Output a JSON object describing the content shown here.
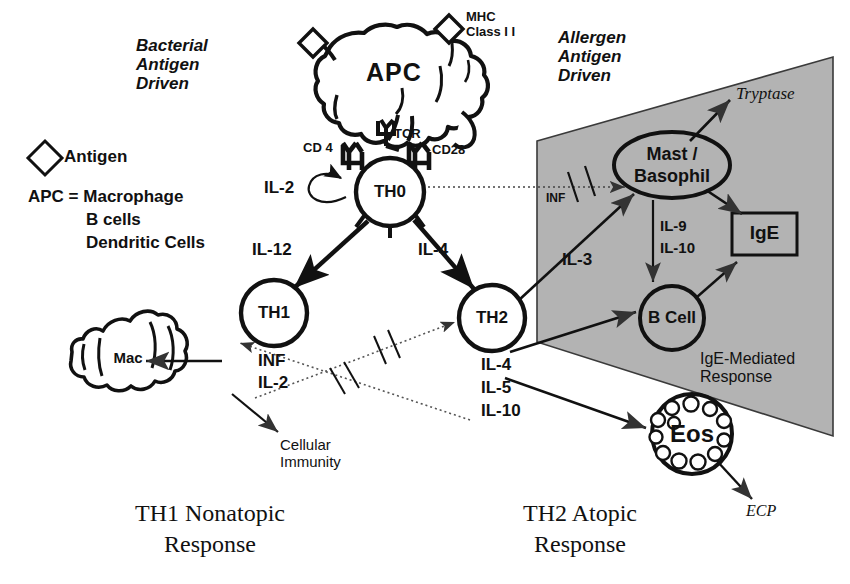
{
  "diagram": {
    "title_left": "TH1 Nonatopic\nResponse",
    "title_right": "TH2 Atopic\nResponse",
    "headers": {
      "left": "Bacterial\nAntigen\nDriven",
      "right": "Allergen\nAntigen\nDriven"
    },
    "legend": {
      "antigen_label": "Antigen",
      "apc_line1": "APC = Macrophage",
      "apc_line2": "B cells",
      "apc_line3": "Dendritic Cells"
    },
    "cells": {
      "apc": "APC",
      "th0": "TH0",
      "th1": "TH1",
      "th2": "TH2",
      "mac": "Mac",
      "mast": "Mast /",
      "basophil": "Basophil",
      "bcell": "B Cell",
      "eos": "Eos",
      "ige": "IgE"
    },
    "receptors": {
      "mhc": "MHC\nClass I I",
      "cd4": "CD 4",
      "tcr": "TCR",
      "cd28": "CD28"
    },
    "cytokines": {
      "il2_auto": "IL-2",
      "il12": "IL-12",
      "il4_th0": "IL-4",
      "inf_block": "INF",
      "il2_block": "IL-2",
      "il3": "IL-3",
      "inf_gray": "INF",
      "il9": "IL-9",
      "il10_mast": "IL-10",
      "th2_il4": "IL-4",
      "th2_il5": "IL-5",
      "th2_il10": "IL-10"
    },
    "mediators": {
      "tryptase": "Tryptase",
      "ecp": "ECP",
      "cellular_immunity": "Cellular\nImmunity",
      "ige_mediated": "IgE-Mediated\nResponse"
    },
    "colors": {
      "gray_panel": "#b3b3b3",
      "panel_edge": "#3a3a3a",
      "ink": "#111111"
    }
  }
}
